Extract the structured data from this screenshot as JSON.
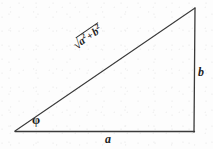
{
  "figure": {
    "background_color": "#fdfdfd",
    "line_color": "#2a2a2a",
    "text_color": "#1c1c1c",
    "width": 213,
    "height": 149
  },
  "labels": {
    "base": "a",
    "height": "b",
    "angle": "φ",
    "hypotenuse": {
      "radical": "√",
      "term1": "a",
      "term1_exponent": "2",
      "operator": "+",
      "term2": "b",
      "term2_exponent": "2",
      "full": "√(a² + b²)"
    }
  },
  "geometry": {
    "vertices": {
      "left": [
        15,
        131
      ],
      "top_right": [
        195,
        8
      ],
      "bottom_right": [
        194,
        132
      ]
    },
    "sides": [
      {
        "name": "base",
        "from": "left",
        "to": "bottom_right",
        "label": "a"
      },
      {
        "name": "height",
        "from": "bottom_right",
        "to": "top_right",
        "label": "b"
      },
      {
        "name": "hypotenuse",
        "from": "left",
        "to": "top_right",
        "label": "√(a² + b²)"
      }
    ],
    "hypotenuse_angle_deg": -34.5
  }
}
